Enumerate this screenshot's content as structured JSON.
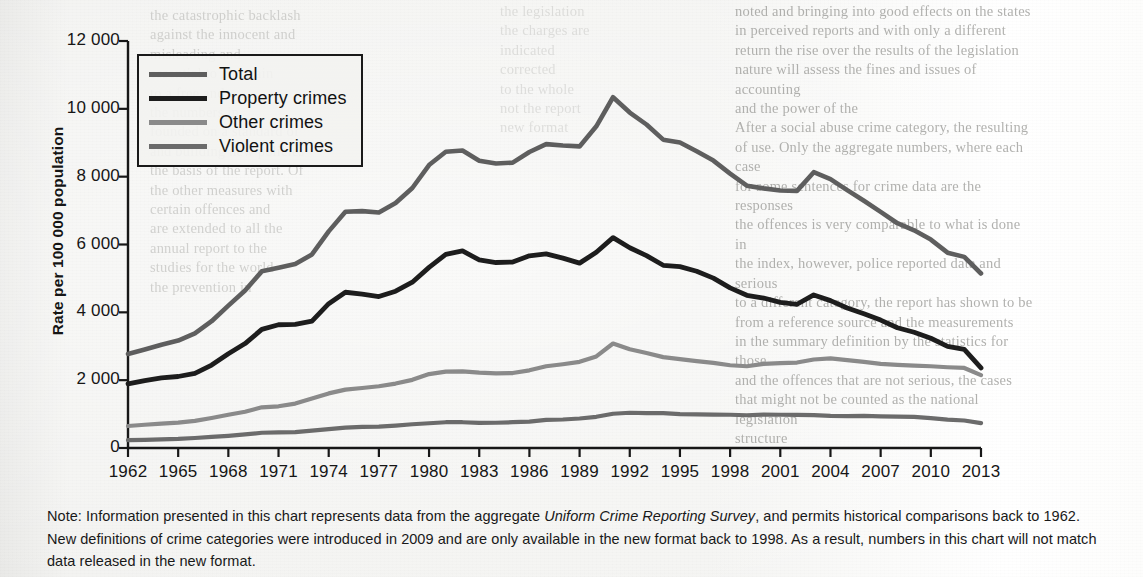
{
  "chart_data": {
    "type": "line",
    "title": "",
    "xlabel": "",
    "ylabel": "Rate per 100 000 population",
    "ylim": [
      0,
      12000
    ],
    "xlim": [
      1962,
      2013
    ],
    "grid": false,
    "legend_position": "top-left",
    "y_ticks": [
      "0",
      "2 000",
      "4 000",
      "6 000",
      "8 000",
      "10 000",
      "12 000"
    ],
    "y_tick_values": [
      0,
      2000,
      4000,
      6000,
      8000,
      10000,
      12000
    ],
    "x_tick_labels": [
      "1962",
      "1965",
      "1968",
      "1971",
      "1974",
      "1977",
      "1980",
      "1983",
      "1986",
      "1989",
      "1992",
      "1995",
      "1998",
      "2001",
      "2004",
      "2007",
      "2010",
      "2013"
    ],
    "x": [
      1962,
      1963,
      1964,
      1965,
      1966,
      1967,
      1968,
      1969,
      1970,
      1971,
      1972,
      1973,
      1974,
      1975,
      1976,
      1977,
      1978,
      1979,
      1980,
      1981,
      1982,
      1983,
      1984,
      1985,
      1986,
      1987,
      1988,
      1989,
      1990,
      1991,
      1992,
      1993,
      1994,
      1995,
      1996,
      1997,
      1998,
      1999,
      2000,
      2001,
      2002,
      2003,
      2004,
      2005,
      2006,
      2007,
      2008,
      2009,
      2010,
      2011,
      2012,
      2013
    ],
    "series": [
      {
        "name": "Total",
        "color": "#5e5e5e",
        "width": 4.6,
        "values": [
          2771,
          2905,
          3045,
          3167,
          3377,
          3738,
          4199,
          4646,
          5208,
          5313,
          5423,
          5706,
          6387,
          6964,
          6984,
          6945,
          7223,
          7666,
          8343,
          8736,
          8773,
          8471,
          8387,
          8413,
          8728,
          8960,
          8919,
          8892,
          9485,
          10342,
          9890,
          9538,
          9091,
          9007,
          8748,
          8474,
          8091,
          7733,
          7655,
          7590,
          7582,
          8132,
          7928,
          7601,
          7288,
          6963,
          6627,
          6420,
          6144,
          5759,
          5635,
          5145
        ]
      },
      {
        "name": "Property crimes",
        "color": "#1d1d1d",
        "width": 4.8,
        "values": [
          1891,
          1989,
          2069,
          2108,
          2199,
          2445,
          2780,
          3079,
          3497,
          3634,
          3647,
          3739,
          4255,
          4592,
          4536,
          4466,
          4624,
          4889,
          5326,
          5709,
          5811,
          5544,
          5469,
          5484,
          5666,
          5723,
          5599,
          5451,
          5772,
          6202,
          5903,
          5673,
          5387,
          5346,
          5213,
          5009,
          4720,
          4502,
          4422,
          4294,
          4238,
          4514,
          4345,
          4128,
          3957,
          3772,
          3547,
          3411,
          3235,
          2997,
          2909,
          2362
        ]
      },
      {
        "name": "Other crimes",
        "color": "#8a8a8a",
        "width": 4.2,
        "values": [
          648,
          685,
          720,
          750,
          800,
          885,
          980,
          1070,
          1200,
          1230,
          1310,
          1460,
          1610,
          1720,
          1770,
          1820,
          1900,
          2010,
          2180,
          2250,
          2260,
          2220,
          2200,
          2210,
          2290,
          2410,
          2470,
          2540,
          2700,
          3080,
          2910,
          2800,
          2680,
          2620,
          2560,
          2510,
          2440,
          2410,
          2480,
          2500,
          2520,
          2610,
          2640,
          2590,
          2540,
          2480,
          2450,
          2430,
          2410,
          2380,
          2360,
          2150
        ]
      },
      {
        "name": "Violent crimes",
        "color": "#6b6b6b",
        "width": 4.2,
        "values": [
          232,
          241,
          256,
          270,
          295,
          330,
          360,
          400,
          450,
          460,
          470,
          510,
          555,
          600,
          620,
          630,
          660,
          700,
          730,
          760,
          760,
          740,
          745,
          760,
          780,
          830,
          840,
          870,
          920,
          1010,
          1040,
          1030,
          1030,
          1000,
          990,
          985,
          980,
          965,
          985,
          980,
          975,
          970,
          945,
          940,
          950,
          935,
          925,
          915,
          880,
          835,
          810,
          735
        ]
      }
    ]
  },
  "legend": {
    "items": [
      {
        "label": "Total",
        "color": "#5e5e5e"
      },
      {
        "label": "Property crimes",
        "color": "#1d1d1d"
      },
      {
        "label": "Other crimes",
        "color": "#8a8a8a"
      },
      {
        "label": "Violent crimes",
        "color": "#6b6b6b"
      }
    ]
  },
  "note": {
    "lead": "Note: Information presented in this chart represents data from the aggregate ",
    "italic": "Uniform Crime Reporting Survey",
    "tail": ", and permits historical comparisons back to 1962. New definitions of crime categories were introduced in 2009 and are only available in the new format back to 1998. As a result, numbers in this chart will not match data released in the new format."
  },
  "bleed_through": {
    "left": "the catastrophic backlash\nagainst the innocent and\nmisleading and\nessential to maintain\nto a free and\nthe numbers in\nfounded on a standard of\nand building new policies\nthe basis of the report. Of\nthe other measures with\ncertain offences and\nare extended to all the\nannual report to the\nstudies for the world\nthe prevention in",
    "mid": "the legislation\nthe charges are\nindicated\ncorrected\nto the whole\nnot the report\nnew format",
    "right": "noted and bringing into good effects on  the states\nin perceived reports and with only a different\nreturn the rise over the results of the legislation\nnature will assess the fines and issues of accounting\nand the power of the\nAfter a social abuse crime category, the resulting\nof use. Only the aggregate numbers, where each case\nfor some sentences for crime data are  the responses\nthe offences is very comparable to what is done in\nthe index, however, police reported data and serious\nto a different category, the report has shown to be\nfrom a reference source and the measurements\nin the summary definition by the statistics for those\nand the offences that are not serious, the cases\nthat might not be counted as the national legislation\nstructure"
  }
}
